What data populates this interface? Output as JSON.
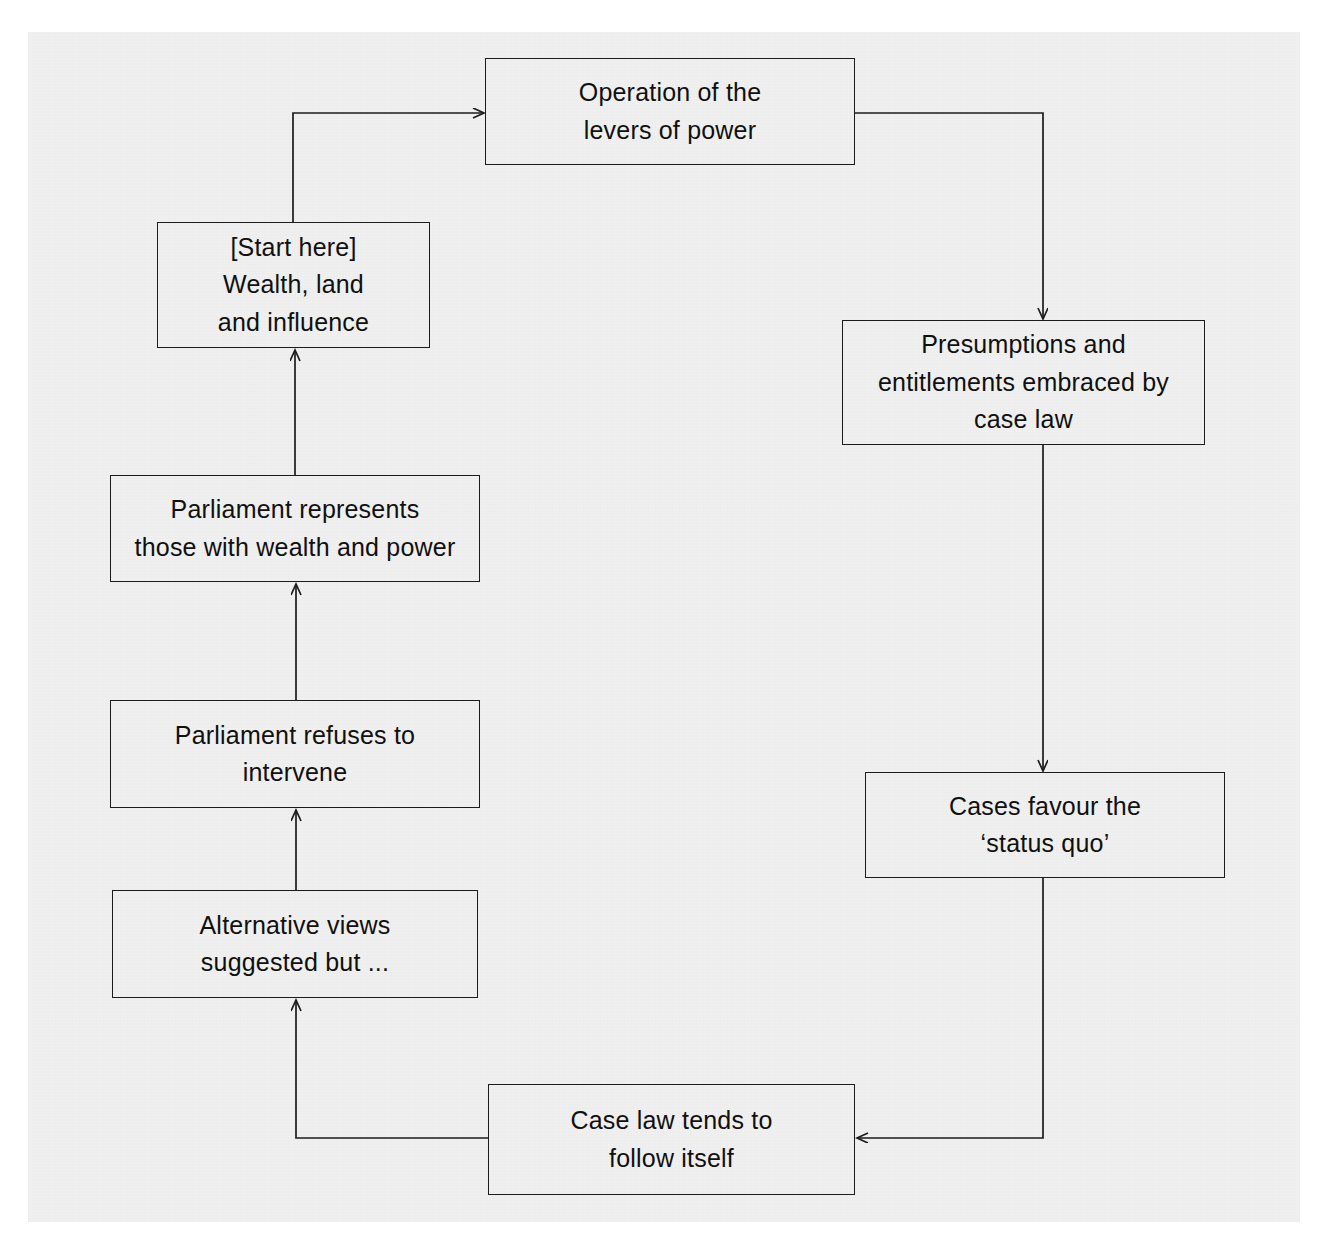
{
  "diagram": {
    "type": "flowchart",
    "title_sliver": "",
    "background_color": "#f1f1f1",
    "line_color": "#1c1c1c",
    "text_color": "#101010",
    "nodes": [
      {
        "id": "operation",
        "label": "Operation of the\nlevers of power",
        "x": 485,
        "y": 58,
        "w": 370,
        "h": 107
      },
      {
        "id": "wealth",
        "label": "[Start here]\nWealth, land\nand influence",
        "x": 157,
        "y": 222,
        "w": 273,
        "h": 126
      },
      {
        "id": "parliament-represents",
        "label": "Parliament represents\nthose with wealth and power",
        "x": 110,
        "y": 475,
        "w": 370,
        "h": 107
      },
      {
        "id": "parliament-refuses",
        "label": "Parliament refuses to\nintervene",
        "x": 110,
        "y": 700,
        "w": 370,
        "h": 108
      },
      {
        "id": "alternative-views",
        "label": "Alternative views\nsuggested but ...",
        "x": 112,
        "y": 890,
        "w": 366,
        "h": 108
      },
      {
        "id": "presumptions",
        "label": "Presumptions and\nentitlements embraced by\ncase law",
        "x": 842,
        "y": 320,
        "w": 363,
        "h": 125
      },
      {
        "id": "cases-favour",
        "label": "Cases favour the\n‘status quo’",
        "x": 865,
        "y": 772,
        "w": 360,
        "h": 106
      },
      {
        "id": "case-law-follows",
        "label": "Case law tends to\nfollow itself",
        "x": 488,
        "y": 1084,
        "w": 367,
        "h": 111
      }
    ],
    "edges": [
      {
        "id": "wealth-to-operation",
        "from": "wealth",
        "to": "operation",
        "arrow": "right"
      },
      {
        "id": "operation-to-presumptions",
        "from": "operation",
        "to": "presumptions",
        "arrow": "down"
      },
      {
        "id": "presumptions-to-cases",
        "from": "presumptions",
        "to": "cases-favour",
        "arrow": "down"
      },
      {
        "id": "cases-to-case-law",
        "from": "cases-favour",
        "to": "case-law-follows",
        "arrow": "left"
      },
      {
        "id": "case-law-to-alternative",
        "from": "case-law-follows",
        "to": "alternative-views",
        "arrow": "up"
      },
      {
        "id": "alternative-to-refuses",
        "from": "alternative-views",
        "to": "parliament-refuses",
        "arrow": "up"
      },
      {
        "id": "refuses-to-represents",
        "from": "parliament-refuses",
        "to": "parliament-represents",
        "arrow": "up"
      },
      {
        "id": "represents-to-wealth",
        "from": "parliament-represents",
        "to": "wealth",
        "arrow": "up"
      }
    ]
  }
}
